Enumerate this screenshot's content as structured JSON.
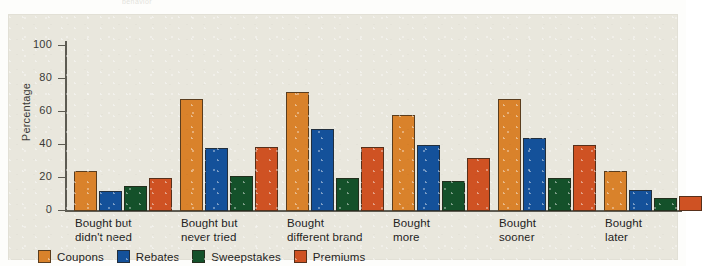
{
  "figure": {
    "caption_fragment": "behavior",
    "panel_background": "#e9e7dd"
  },
  "chart_data": {
    "type": "bar",
    "title": "",
    "xlabel": "",
    "ylabel": "Percentage",
    "ylim": [
      0,
      100
    ],
    "yticks": [
      0,
      20,
      40,
      60,
      80,
      100
    ],
    "ytick_labels": [
      "0",
      "20",
      "40",
      "60",
      "80",
      "100"
    ],
    "grid": false,
    "legend_position": "bottom-left",
    "categories": [
      "Bought but\ndidn't need",
      "Bought but\nnever tried",
      "Bought\ndifferent brand",
      "Bought\nmore",
      "Bought\nsooner",
      "Bought\nlater"
    ],
    "series": [
      {
        "name": "Coupons",
        "color": "#d9822b",
        "values": [
          24,
          68,
          72,
          58,
          68,
          24
        ]
      },
      {
        "name": "Rebates",
        "color": "#14519a",
        "values": [
          12,
          38,
          50,
          40,
          44,
          13
        ]
      },
      {
        "name": "Sweepstakes",
        "color": "#14512a",
        "values": [
          15,
          21,
          20,
          18,
          20,
          8
        ]
      },
      {
        "name": "Premiums",
        "color": "#cf5223",
        "values": [
          20,
          39,
          39,
          32,
          40,
          9
        ]
      }
    ]
  }
}
